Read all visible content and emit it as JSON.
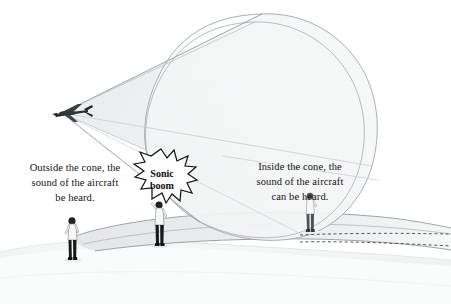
{
  "diagram": {
    "captions": {
      "outside": "Outside the cone, the\nsound of the aircraft\nbe heard.",
      "inside": "Inside the cone, the\nsound of the aircraft\ncan be heard."
    },
    "boom_label": "Sonic\nboom",
    "elements": {
      "aircraft": "aircraft",
      "cone": "shock-wave-cone",
      "ground": "ground-terrain",
      "observer_left": "observer-outside-cone",
      "observer_middle": "observer-at-boom",
      "observer_right": "observer-inside-cone"
    },
    "colors": {
      "background": "#ffffff",
      "cone_fill": "#eceff0",
      "cone_stroke": "#9aa0a6",
      "ground_fill": "#f3f4f5",
      "ground_shade": "#e6e9ea",
      "text": "#111111",
      "figure_dark": "#1a1a1a",
      "figure_light": "#f7f7f7",
      "boom_stroke": "#1a1a1a",
      "dashed_stroke": "#3a3a3a"
    }
  }
}
